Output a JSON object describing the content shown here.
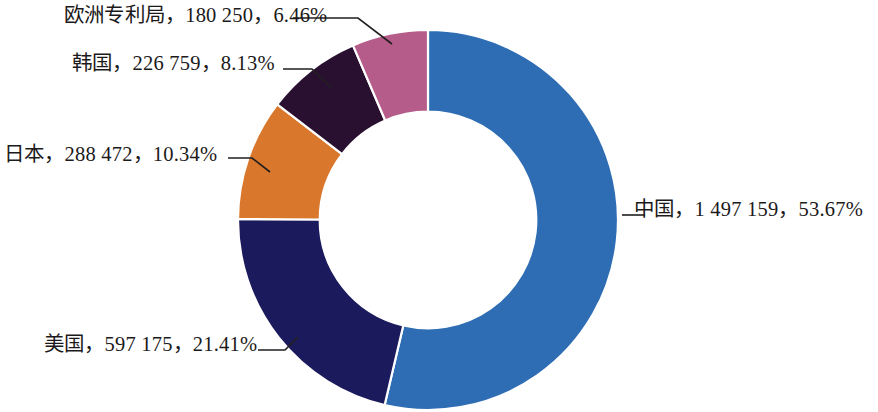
{
  "chart_data": {
    "type": "pie",
    "variant": "donut",
    "title": "",
    "subtitle": "",
    "xlabel": "",
    "ylabel": "",
    "legend": "none",
    "grid": false,
    "label_format": "名称，数量，占比",
    "start_angle_deg": 0,
    "direction": "clockwise",
    "hole_ratio": 0.57,
    "total": 2790815,
    "categories": [
      "中国",
      "美国",
      "日本",
      "韩国",
      "欧洲专利局"
    ],
    "values": [
      1497159,
      597175,
      288472,
      226759,
      180250
    ],
    "percents": [
      53.67,
      21.41,
      10.34,
      8.13,
      6.46
    ],
    "colors": [
      "#2e6db4",
      "#1a1a5c",
      "#d9782c",
      "#2a1030",
      "#b55c8a"
    ],
    "slices": [
      {
        "name": "中国",
        "value": 1497159,
        "value_text": "1 497 159",
        "percent": 53.67,
        "percent_text": "53.67%",
        "color": "#2e6db4",
        "label": "中国，1 497 159，53.67%"
      },
      {
        "name": "美国",
        "value": 597175,
        "value_text": "597 175",
        "percent": 21.41,
        "percent_text": "21.41%",
        "color": "#1a1a5c",
        "label": "美国，597 175，21.41%"
      },
      {
        "name": "日本",
        "value": 288472,
        "value_text": "288 472",
        "percent": 10.34,
        "percent_text": "10.34%",
        "color": "#d9782c",
        "label": "日本，288 472，10.34%"
      },
      {
        "name": "韩国",
        "value": 226759,
        "value_text": "226 759",
        "percent": 8.13,
        "percent_text": "8.13%",
        "color": "#2a1030",
        "label": "韩国，226 759，8.13%"
      },
      {
        "name": "欧洲专利局",
        "value": 180250,
        "value_text": "180 250",
        "percent": 6.46,
        "percent_text": "6.46%",
        "color": "#b55c8a",
        "label": "欧洲专利局，180 250，6.46%"
      }
    ]
  },
  "labels": {
    "china": "中国，1 497 159，53.67%",
    "usa": "美国，597 175，21.41%",
    "japan": "日本，288 472，10.34%",
    "korea": "韩国，226 759，8.13%",
    "epo": "欧洲专利局，180 250，6.46%"
  },
  "theme": {
    "background": "#ffffff",
    "text_color": "#1c1a1a",
    "leader_color": "#221f1f",
    "slice_border": "#ffffff"
  }
}
